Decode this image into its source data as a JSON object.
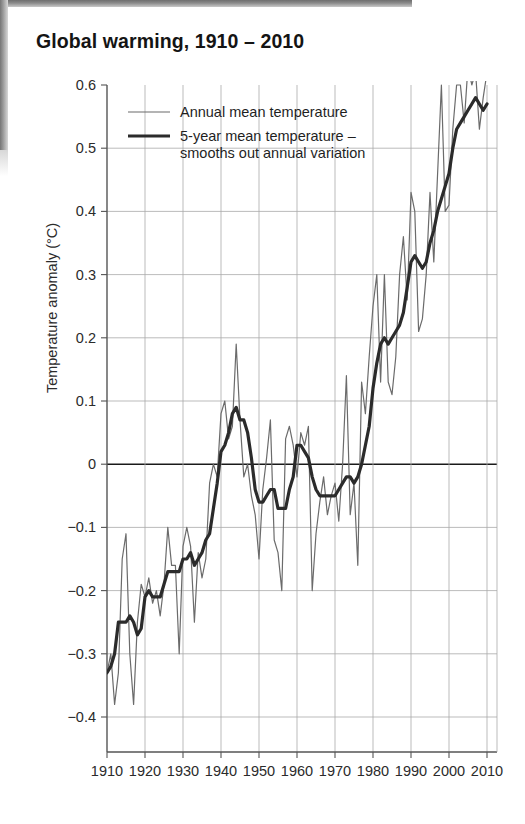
{
  "chart_title": "Global warming, 1910 – 2010",
  "axis": {
    "ylabel": "Temperature anomaly (°C)",
    "ytick_labels": [
      "0.6",
      "0.5",
      "0.4",
      "0.3",
      "0.2",
      "0.1",
      "0",
      "−0.1",
      "−0.2",
      "−0.3",
      "−0.4"
    ],
    "xtick_labels": [
      "1910",
      "1920",
      "1930",
      "1940",
      "1950",
      "1960",
      "1970",
      "1980",
      "1990",
      "2000",
      "2010"
    ]
  },
  "legend": {
    "items": [
      {
        "label": "Annual mean temperature",
        "label2": "",
        "color": "#6b6b6b",
        "width": 1.2
      },
      {
        "label": "5-year mean temperature –",
        "label2": "smooths out annual variation",
        "color": "#2b2b2b",
        "width": 3.2
      }
    ]
  },
  "colors": {
    "annual_line": "#6b6b6b",
    "mean_line": "#2b2b2b",
    "grid": "#a9a9a9",
    "axis": "#555555",
    "zero_line": "#1a1a1a",
    "background": "#ffffff"
  },
  "chart_data": {
    "type": "line",
    "title": "Global warming, 1910 – 2010",
    "xlabel": "",
    "ylabel": "Temperature anomaly (°C)",
    "xlim": [
      1909,
      2011
    ],
    "ylim": [
      -0.45,
      0.65
    ],
    "yticks": [
      0.6,
      0.5,
      0.4,
      0.3,
      0.2,
      0.1,
      0,
      -0.1,
      -0.2,
      -0.3,
      -0.4
    ],
    "xticks": [
      1910,
      1920,
      1930,
      1940,
      1950,
      1960,
      1970,
      1980,
      1990,
      2000,
      2010
    ],
    "grid": true,
    "legend_position": "top-left",
    "x": [
      1910,
      1911,
      1912,
      1913,
      1914,
      1915,
      1916,
      1917,
      1918,
      1919,
      1920,
      1921,
      1922,
      1923,
      1924,
      1925,
      1926,
      1927,
      1928,
      1929,
      1930,
      1931,
      1932,
      1933,
      1934,
      1935,
      1936,
      1937,
      1938,
      1939,
      1940,
      1941,
      1942,
      1943,
      1944,
      1945,
      1946,
      1947,
      1948,
      1949,
      1950,
      1951,
      1952,
      1953,
      1954,
      1955,
      1956,
      1957,
      1958,
      1959,
      1960,
      1961,
      1962,
      1963,
      1964,
      1965,
      1966,
      1967,
      1968,
      1969,
      1970,
      1971,
      1972,
      1973,
      1974,
      1975,
      1976,
      1977,
      1978,
      1979,
      1980,
      1981,
      1982,
      1983,
      1984,
      1985,
      1986,
      1987,
      1988,
      1989,
      1990,
      1991,
      1992,
      1993,
      1994,
      1995,
      1996,
      1997,
      1998,
      1999,
      2000,
      2001,
      2002,
      2003,
      2004,
      2005,
      2006,
      2007,
      2008,
      2009,
      2010
    ],
    "series": [
      {
        "name": "Annual mean temperature",
        "color": "#6b6b6b",
        "linewidth": 1.2,
        "values": [
          -0.33,
          -0.3,
          -0.38,
          -0.33,
          -0.15,
          -0.11,
          -0.3,
          -0.38,
          -0.25,
          -0.19,
          -0.21,
          -0.18,
          -0.22,
          -0.2,
          -0.24,
          -0.19,
          -0.1,
          -0.16,
          -0.16,
          -0.3,
          -0.13,
          -0.1,
          -0.13,
          -0.25,
          -0.14,
          -0.18,
          -0.15,
          -0.03,
          0.0,
          -0.02,
          0.08,
          0.1,
          0.04,
          0.06,
          0.19,
          0.07,
          -0.02,
          0.0,
          -0.05,
          -0.08,
          -0.15,
          -0.04,
          0.01,
          0.07,
          -0.12,
          -0.14,
          -0.2,
          0.04,
          0.06,
          0.03,
          -0.02,
          0.05,
          0.03,
          0.06,
          -0.2,
          -0.11,
          -0.06,
          -0.02,
          -0.08,
          -0.05,
          -0.03,
          -0.09,
          0.0,
          0.14,
          -0.08,
          -0.03,
          -0.16,
          0.13,
          0.08,
          0.17,
          0.25,
          0.3,
          0.13,
          0.3,
          0.13,
          0.11,
          0.17,
          0.3,
          0.36,
          0.26,
          0.43,
          0.4,
          0.21,
          0.23,
          0.3,
          0.43,
          0.32,
          0.46,
          0.6,
          0.4,
          0.41,
          0.53,
          0.6,
          0.6,
          0.54,
          0.63,
          0.6,
          0.62,
          0.53,
          0.58,
          0.62
        ]
      },
      {
        "name": "5-year mean temperature",
        "color": "#2b2b2b",
        "linewidth": 3.2,
        "values": [
          -0.33,
          -0.32,
          -0.3,
          -0.25,
          -0.25,
          -0.25,
          -0.24,
          -0.25,
          -0.27,
          -0.26,
          -0.21,
          -0.2,
          -0.21,
          -0.21,
          -0.21,
          -0.19,
          -0.17,
          -0.17,
          -0.17,
          -0.17,
          -0.15,
          -0.15,
          -0.14,
          -0.16,
          -0.15,
          -0.14,
          -0.12,
          -0.11,
          -0.07,
          -0.03,
          0.02,
          0.03,
          0.05,
          0.08,
          0.09,
          0.07,
          0.07,
          0.05,
          0.01,
          -0.04,
          -0.06,
          -0.06,
          -0.05,
          -0.04,
          -0.04,
          -0.07,
          -0.07,
          -0.07,
          -0.04,
          -0.02,
          0.03,
          0.03,
          0.02,
          0.01,
          -0.02,
          -0.04,
          -0.05,
          -0.05,
          -0.05,
          -0.05,
          -0.05,
          -0.04,
          -0.03,
          -0.02,
          -0.02,
          -0.03,
          -0.02,
          0.0,
          0.03,
          0.06,
          0.12,
          0.16,
          0.19,
          0.2,
          0.19,
          0.2,
          0.21,
          0.22,
          0.24,
          0.28,
          0.32,
          0.33,
          0.32,
          0.31,
          0.32,
          0.35,
          0.37,
          0.4,
          0.42,
          0.44,
          0.46,
          0.5,
          0.53,
          0.54,
          0.55,
          0.56,
          0.57,
          0.58,
          0.57,
          0.56,
          0.57
        ]
      }
    ]
  }
}
